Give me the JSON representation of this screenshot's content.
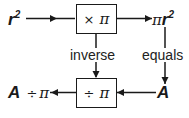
{
  "diagram": {
    "input": {
      "base": "r",
      "exponent": "2"
    },
    "top_box": {
      "operator": "×",
      "operand": "π"
    },
    "output": {
      "prefix": "π",
      "base": "r",
      "exponent": "2"
    },
    "inverse_label": "inverse",
    "equals_label": "equals",
    "bottom_input": "A",
    "bottom_box": {
      "operator": "÷",
      "operand": "π"
    },
    "bottom_output": {
      "var": "A",
      "operator": "÷",
      "operand": "π"
    }
  },
  "colors": {
    "ink": "#1a1a1a",
    "background": "#ffffff"
  }
}
